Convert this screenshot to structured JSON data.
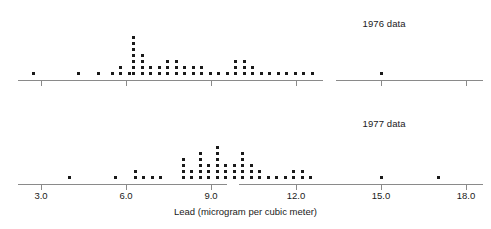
{
  "chart_data": {
    "type": "dotplot",
    "title": "",
    "xlabel": "Lead (microgram per cubic meter)",
    "ylabel": "",
    "xlim": [
      2.2,
      18.6
    ],
    "xticks": [
      3.0,
      6.0,
      9.0,
      12.0,
      15.0,
      18.0
    ],
    "xtick_labels": [
      "3.0",
      "6.0",
      "9.0",
      "12.0",
      "15.0",
      "18.0"
    ],
    "grid": false,
    "legend_position": "inside-right",
    "dot_size_px": 3,
    "panels": [
      {
        "name": "1976",
        "label": "1976 data",
        "label_x": 14.35,
        "axis_break": [
          12.95,
          13.4
        ],
        "values": [
          2.7,
          4.3,
          5.0,
          5.5,
          5.5,
          5.8,
          5.8,
          5.8,
          6.1,
          6.1,
          6.1,
          6.1,
          6.1,
          6.1,
          6.1,
          6.1,
          6.4,
          6.4,
          6.4,
          6.4,
          6.4,
          6.4,
          6.7,
          6.7,
          7.0,
          7.0,
          7.0,
          7.3,
          7.3,
          7.3,
          7.6,
          7.6,
          7.6,
          7.9,
          7.9,
          8.2,
          8.2,
          8.5,
          8.5,
          8.8,
          8.8,
          9.1,
          9.1,
          9.1,
          9.4,
          9.4,
          9.4,
          9.7,
          9.7,
          9.7,
          10.0,
          10.3,
          10.6,
          10.9,
          10.9,
          11.2,
          11.2,
          11.5,
          11.8,
          12.1,
          12.4,
          15.0
        ],
        "columns": [
          {
            "value": 2.7,
            "count": 1
          },
          {
            "value": 4.3,
            "count": 1
          },
          {
            "value": 5.0,
            "count": 1
          },
          {
            "value": 5.5,
            "count": 1
          },
          {
            "value": 5.8,
            "count": 2
          },
          {
            "value": 6.1,
            "count": 1
          },
          {
            "value": 6.25,
            "count": 7
          },
          {
            "value": 6.55,
            "count": 4
          },
          {
            "value": 6.85,
            "count": 2
          },
          {
            "value": 7.15,
            "count": 2
          },
          {
            "value": 7.45,
            "count": 3
          },
          {
            "value": 7.75,
            "count": 3
          },
          {
            "value": 8.05,
            "count": 2
          },
          {
            "value": 8.35,
            "count": 2
          },
          {
            "value": 8.65,
            "count": 2
          },
          {
            "value": 8.95,
            "count": 1
          },
          {
            "value": 9.25,
            "count": 1
          },
          {
            "value": 9.55,
            "count": 1
          },
          {
            "value": 9.85,
            "count": 3
          },
          {
            "value": 10.15,
            "count": 3
          },
          {
            "value": 10.45,
            "count": 2
          },
          {
            "value": 10.75,
            "count": 1
          },
          {
            "value": 11.05,
            "count": 1
          },
          {
            "value": 11.35,
            "count": 1
          },
          {
            "value": 11.65,
            "count": 1
          },
          {
            "value": 11.95,
            "count": 1
          },
          {
            "value": 12.25,
            "count": 1
          },
          {
            "value": 12.55,
            "count": 1
          },
          {
            "value": 15.0,
            "count": 1
          }
        ]
      },
      {
        "name": "1977",
        "label": "1977 data",
        "label_x": 14.35,
        "axis_break": [
          9.55,
          10.0
        ],
        "values": [
          4.0,
          5.6,
          6.3,
          6.6,
          6.6,
          6.9,
          7.2,
          8.0,
          8.0,
          8.0,
          8.0,
          8.0,
          8.3,
          8.6,
          8.6,
          8.6,
          8.6,
          8.9,
          8.9,
          8.9,
          8.9,
          8.9,
          9.2,
          9.2,
          9.2,
          9.2,
          9.2,
          9.2,
          9.5,
          9.5,
          9.5,
          9.5,
          9.8,
          9.8,
          9.8,
          9.8,
          10.1,
          10.1,
          10.4,
          10.7,
          11.0,
          11.3,
          11.3,
          11.6,
          11.6,
          11.9,
          12.2,
          15.0,
          17.0
        ],
        "columns": [
          {
            "value": 4.0,
            "count": 1
          },
          {
            "value": 5.6,
            "count": 1
          },
          {
            "value": 6.3,
            "count": 2
          },
          {
            "value": 6.6,
            "count": 1
          },
          {
            "value": 6.9,
            "count": 1
          },
          {
            "value": 7.2,
            "count": 1
          },
          {
            "value": 8.0,
            "count": 4
          },
          {
            "value": 8.3,
            "count": 2
          },
          {
            "value": 8.6,
            "count": 5
          },
          {
            "value": 8.9,
            "count": 3
          },
          {
            "value": 9.2,
            "count": 6
          },
          {
            "value": 9.5,
            "count": 3
          },
          {
            "value": 9.8,
            "count": 3
          },
          {
            "value": 10.1,
            "count": 5
          },
          {
            "value": 10.4,
            "count": 3
          },
          {
            "value": 10.7,
            "count": 2
          },
          {
            "value": 11.0,
            "count": 1
          },
          {
            "value": 11.3,
            "count": 1
          },
          {
            "value": 11.6,
            "count": 1
          },
          {
            "value": 11.9,
            "count": 2
          },
          {
            "value": 12.2,
            "count": 2
          },
          {
            "value": 12.5,
            "count": 1
          },
          {
            "value": 15.0,
            "count": 1
          },
          {
            "value": 17.0,
            "count": 1
          }
        ]
      }
    ]
  }
}
